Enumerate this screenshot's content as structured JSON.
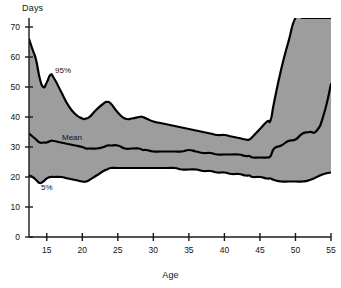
{
  "chart_data": {
    "type": "line",
    "title": "",
    "subtitle": "",
    "xlabel": "Age",
    "ylabel": "Days",
    "xlim": [
      12.5,
      55
    ],
    "ylim": [
      0,
      73
    ],
    "grid": false,
    "legend_position": "inline-annotations",
    "fill_between": {
      "lower_series": "5%",
      "upper_series": "95%",
      "color": "#9d9d9d"
    },
    "xticks": [
      15,
      20,
      25,
      30,
      35,
      40,
      45,
      50,
      55
    ],
    "yticks": [
      0,
      10,
      20,
      30,
      40,
      50,
      60,
      70
    ],
    "x": [
      12.5,
      13,
      13.5,
      14,
      14.5,
      15,
      15.5,
      16,
      17,
      18,
      19,
      20,
      20.5,
      21,
      22,
      23,
      23.5,
      24,
      25,
      26,
      27,
      28,
      28.5,
      29,
      30,
      31,
      32,
      33,
      34,
      35,
      36,
      37,
      38,
      39,
      40,
      41,
      42,
      43,
      43.5,
      44,
      45,
      46,
      46.5,
      47,
      48,
      49,
      50,
      51,
      52,
      53,
      54,
      55
    ],
    "series": [
      {
        "name": "95%",
        "label": "95%",
        "values": [
          66.0,
          62.5,
          59.0,
          53.0,
          50.0,
          51.5,
          54.0,
          53.0,
          48.5,
          44.0,
          41.0,
          39.5,
          39.5,
          40.0,
          42.5,
          44.5,
          45.0,
          44.5,
          41.5,
          39.5,
          39.5,
          40.0,
          40.0,
          39.5,
          38.5,
          38.0,
          37.5,
          37.0,
          36.5,
          36.0,
          35.5,
          35.0,
          34.5,
          34.0,
          34.0,
          33.5,
          33.0,
          32.5,
          32.5,
          33.5,
          36.0,
          38.5,
          39.0,
          45.0,
          56.0,
          65.0,
          73.0,
          73.0,
          73.0,
          73.0,
          73.0,
          73.0
        ]
      },
      {
        "name": "Mean",
        "label": "Mean",
        "values": [
          34.5,
          33.5,
          32.5,
          31.5,
          31.5,
          31.5,
          32.0,
          32.0,
          31.5,
          31.0,
          30.5,
          30.0,
          29.5,
          29.5,
          29.5,
          30.0,
          30.5,
          30.5,
          30.5,
          29.5,
          29.5,
          29.5,
          29.0,
          29.0,
          28.5,
          28.5,
          28.5,
          28.5,
          28.5,
          29.0,
          28.5,
          28.0,
          28.0,
          27.5,
          27.5,
          27.5,
          27.5,
          27.0,
          27.0,
          26.5,
          26.5,
          26.5,
          27.0,
          29.5,
          30.5,
          32.0,
          32.5,
          34.5,
          35.0,
          35.5,
          41.0,
          51.0
        ]
      },
      {
        "name": "5%",
        "label": "5%",
        "values": [
          20.5,
          20.0,
          19.0,
          18.0,
          18.5,
          19.5,
          20.0,
          20.0,
          20.0,
          19.5,
          19.0,
          18.5,
          18.5,
          19.0,
          20.5,
          22.0,
          22.5,
          23.0,
          23.0,
          23.0,
          23.0,
          23.0,
          23.0,
          23.0,
          23.0,
          23.0,
          23.0,
          23.0,
          22.5,
          22.5,
          22.5,
          22.0,
          22.0,
          21.5,
          21.5,
          21.0,
          21.0,
          20.5,
          20.5,
          20.0,
          20.0,
          19.5,
          19.5,
          19.0,
          18.5,
          18.5,
          18.5,
          18.5,
          19.0,
          20.0,
          21.0,
          21.5
        ]
      }
    ]
  },
  "axes": {
    "y_title": "Days",
    "x_title": "Age",
    "y_tick_labels": [
      "0",
      "10",
      "20",
      "30",
      "40",
      "50",
      "60",
      "70"
    ],
    "x_tick_labels": [
      "15",
      "20",
      "25",
      "30",
      "35",
      "40",
      "45",
      "50",
      "55"
    ]
  },
  "annotations": {
    "upper": "95%",
    "middle": "Mean",
    "lower": "5%"
  },
  "colors": {
    "band_fill": "#9d9d9d",
    "curve": "#000000",
    "axis": "#1a1a1a",
    "background": "#ffffff",
    "text": "#121212"
  }
}
